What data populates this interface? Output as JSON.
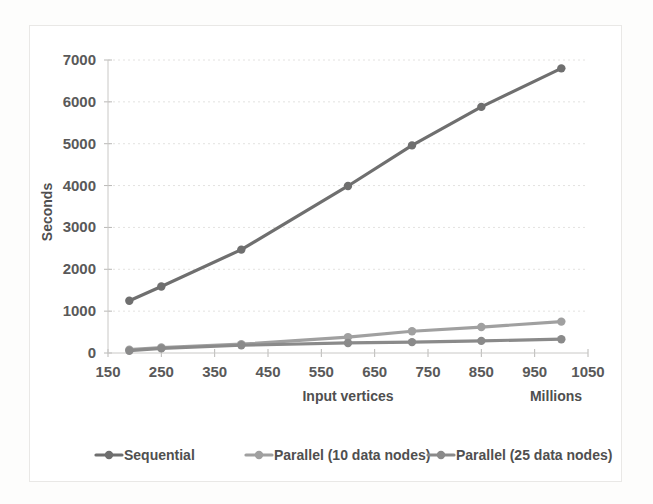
{
  "chart_data": {
    "type": "line",
    "title": "",
    "subtitle": "",
    "xlabel": "Input vertices",
    "xlabel_secondary": "Millions",
    "ylabel": "Seconds",
    "xlim": [
      150,
      1050
    ],
    "ylim": [
      0,
      7000
    ],
    "x_ticks": [
      150,
      250,
      350,
      450,
      550,
      650,
      750,
      850,
      950,
      1050
    ],
    "y_ticks": [
      0,
      1000,
      2000,
      3000,
      4000,
      5000,
      6000,
      7000
    ],
    "x_tick_labels": [
      "150",
      "250",
      "350",
      "450",
      "550",
      "650",
      "750",
      "850",
      "950",
      "1050"
    ],
    "y_tick_labels": [
      "0",
      "1000",
      "2000",
      "3000",
      "4000",
      "5000",
      "6000",
      "7000"
    ],
    "grid": true,
    "grid_axis": "y",
    "legend_position": "bottom",
    "x": [
      190,
      250,
      400,
      600,
      720,
      850,
      1000
    ],
    "series": [
      {
        "name": "Sequential",
        "color": "#6f6f6f",
        "marker": "circle",
        "values": [
          1250,
          1590,
          2470,
          3990,
          4960,
          5880,
          6800
        ]
      },
      {
        "name": "Parallel (10 data nodes)",
        "color": "#a0a0a0",
        "marker": "circle",
        "values": [
          80,
          130,
          210,
          380,
          520,
          620,
          750
        ]
      },
      {
        "name": "Parallel (25 data nodes)",
        "color": "#8a8a8a",
        "marker": "circle",
        "values": [
          55,
          110,
          185,
          240,
          260,
          290,
          330
        ]
      }
    ]
  },
  "axes": {
    "y_title": "Seconds",
    "x_title": "Input vertices",
    "x_unit": "Millions"
  },
  "legend": {
    "items": [
      {
        "label": "Sequential",
        "color": "#6f6f6f"
      },
      {
        "label": "Parallel (10 data nodes)",
        "color": "#a0a0a0"
      },
      {
        "label": "Parallel (25 data nodes)",
        "color": "#8a8a8a"
      }
    ]
  }
}
